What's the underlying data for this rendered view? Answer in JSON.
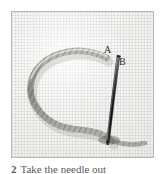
{
  "figure": {
    "kind": "instructional-photograph",
    "frame_border_color": "#b9b9b9",
    "fabric_color": "#f2f2f0",
    "thread_color": "#9a9a96",
    "needle_color": "#1c1c1c",
    "label_color": "#2b2b2b"
  },
  "labels": {
    "point_a": "A",
    "point_b": "B"
  },
  "caption": {
    "step_number": "2",
    "text": "Take the needle out"
  }
}
